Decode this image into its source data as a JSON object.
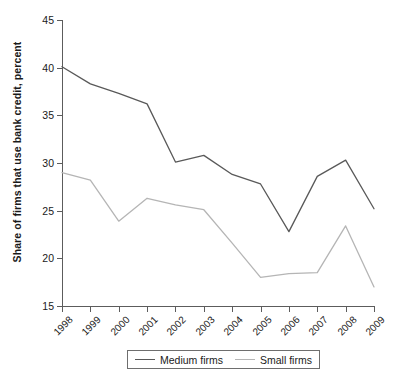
{
  "chart_data": {
    "type": "line",
    "title": "",
    "xlabel": "",
    "ylabel": "Share of firms that use bank credit, percent",
    "categories": [
      "1998",
      "1999",
      "2000",
      "2001",
      "2002",
      "2003",
      "2004",
      "2005",
      "2006",
      "2007",
      "2008",
      "2009"
    ],
    "ylim": [
      15,
      45
    ],
    "yticks": [
      15,
      20,
      25,
      30,
      35,
      40,
      45
    ],
    "ytick_labels": [
      "15",
      "20",
      "25",
      "30",
      "35",
      "40",
      "45"
    ],
    "grid": false,
    "legend_position": "bottom-center",
    "series": [
      {
        "name": "Medium firms",
        "color": "#595959",
        "values": [
          40.1,
          38.3,
          37.3,
          36.2,
          30.1,
          30.8,
          28.8,
          27.8,
          22.8,
          28.6,
          30.3,
          25.2
        ]
      },
      {
        "name": "Small firms",
        "color": "#b5b5b5",
        "values": [
          29.0,
          28.2,
          23.9,
          26.3,
          25.6,
          25.1,
          21.6,
          18.0,
          18.4,
          18.5,
          23.4,
          17.0
        ]
      }
    ]
  },
  "legend": {
    "entries": [
      {
        "label": "Medium firms"
      },
      {
        "label": "Small firms"
      }
    ]
  },
  "colors": {
    "medium_firms": "#595959",
    "small_firms": "#b5b5b5",
    "axis": "#5c5c5c",
    "text": "#1a1a1a",
    "background": "#ffffff"
  },
  "source_note": ""
}
